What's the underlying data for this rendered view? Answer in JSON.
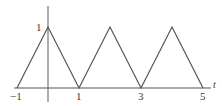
{
  "figure": {
    "width": 222,
    "height": 106,
    "background_color": "#ffffff",
    "line_color": "#555555",
    "axis_color": "#555555",
    "text_color": "#3a3a3a"
  },
  "chart_data": {
    "type": "line",
    "title": "",
    "subtitle": "",
    "xlabel": "t",
    "ylabel": "",
    "grid": false,
    "legend": null,
    "xlim": [
      -1.2,
      5.5
    ],
    "ylim": [
      0,
      1.25
    ],
    "x_ticks": [
      -1,
      1,
      3,
      5
    ],
    "x_tick_labels": [
      "−1",
      "1",
      "3",
      "5"
    ],
    "y_ticks": [
      1
    ],
    "y_tick_labels": [
      "1"
    ],
    "series": [
      {
        "name": "triangle wave",
        "x": [
          -1,
          0,
          1,
          2,
          3,
          4,
          5
        ],
        "values": [
          0,
          1,
          0,
          1,
          0,
          1,
          0
        ]
      }
    ]
  },
  "labels": {
    "x_tick_minus_one": "−1",
    "x_tick_one": "1",
    "x_tick_three": "3",
    "x_tick_five": "5",
    "y_tick_one": "1",
    "t_axis": "t"
  },
  "icons": {
    "x_axis": "horizontal-axis-line",
    "y_axis": "vertical-axis-line",
    "waveform": "triangle-wave-polyline"
  }
}
